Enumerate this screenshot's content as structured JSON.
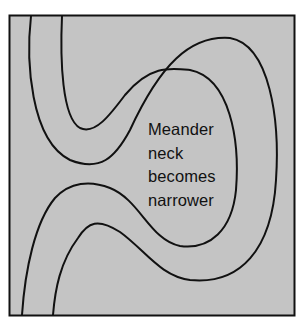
{
  "diagram": {
    "background_color": "#c4c4c4",
    "line_color": "#111111",
    "label_lines": [
      "Meander",
      "neck",
      "becomes",
      "narrower"
    ]
  }
}
